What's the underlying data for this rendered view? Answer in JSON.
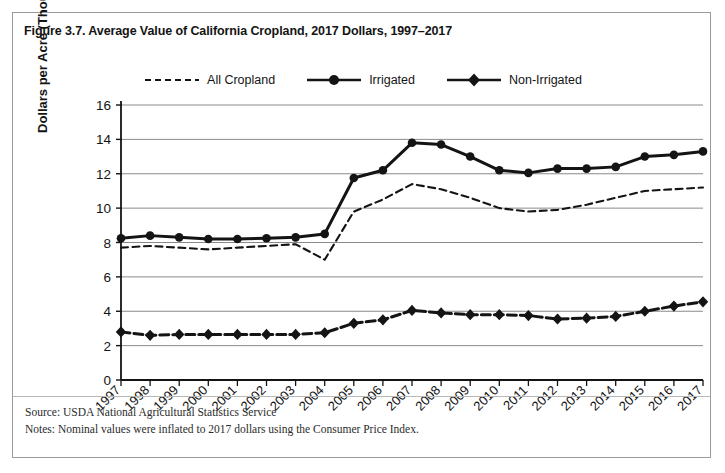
{
  "figure": {
    "title": "Figure 3.7. Average Value of California Cropland, 2017 Dollars, 1997–2017",
    "source_note": "Source: USDA National Agricultural Statistics Service",
    "methods_note": "Notes: Nominal values were inflated to 2017 dollars using the Consumer Price Index."
  },
  "colors": {
    "ink": "#141414",
    "gridline": "#7d7d7d",
    "axis": "#141414",
    "frame_border": "#9a9a9a",
    "background": "#ffffff"
  },
  "chart_data": {
    "type": "line",
    "title": "Figure 3.7. Average Value of California Cropland, 2017 Dollars, 1997–2017",
    "xlabel": "",
    "ylabel": "Dollars per Acre (Thousands)",
    "ylim": [
      0,
      16
    ],
    "ytick_step": 2,
    "yticks": [
      0,
      2,
      4,
      6,
      8,
      10,
      12,
      14,
      16
    ],
    "grid": true,
    "legend_position": "top-center",
    "categories": [
      "1997",
      "1998",
      "1999",
      "2000",
      "2001",
      "2002",
      "2003",
      "2004",
      "2005",
      "2006",
      "2007",
      "2008",
      "2009",
      "2010",
      "2011",
      "2012",
      "2013",
      "2014",
      "2015",
      "2016",
      "2017"
    ],
    "series": [
      {
        "name": "All Cropland",
        "style": "dashed",
        "marker": "none",
        "values": [
          7.7,
          7.8,
          7.7,
          7.6,
          7.7,
          7.8,
          7.9,
          7.0,
          9.8,
          10.5,
          11.4,
          11.1,
          10.6,
          10.0,
          9.8,
          9.9,
          10.2,
          10.6,
          11.0,
          11.1,
          11.2
        ]
      },
      {
        "name": "Irrigated",
        "style": "solid",
        "marker": "circle",
        "values": [
          8.25,
          8.4,
          8.3,
          8.2,
          8.2,
          8.25,
          8.3,
          8.5,
          11.75,
          12.2,
          13.8,
          13.7,
          13.0,
          12.2,
          12.05,
          12.3,
          12.3,
          12.4,
          13.0,
          13.1,
          13.3
        ]
      },
      {
        "name": "Non-Irrigated",
        "style": "dashed-thick",
        "marker": "diamond",
        "values": [
          2.8,
          2.6,
          2.65,
          2.65,
          2.65,
          2.65,
          2.65,
          2.75,
          3.3,
          3.5,
          4.05,
          3.9,
          3.8,
          3.8,
          3.75,
          3.55,
          3.6,
          3.7,
          4.0,
          4.3,
          4.55
        ]
      }
    ]
  }
}
